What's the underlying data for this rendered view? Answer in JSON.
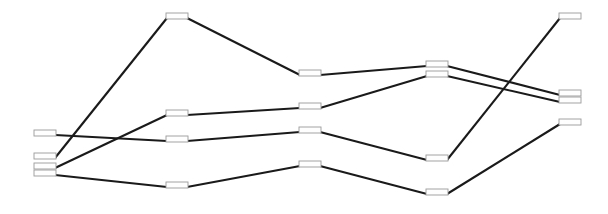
{
  "figure": {
    "type": "node-link-parallel-coordinates",
    "width": 608,
    "height": 214,
    "background_color": "#ffffff",
    "node_fill_color": "#fefefe",
    "node_border_color": "#9a9a9a",
    "link_color": "#1a1a1a",
    "link_width": 2.1,
    "node_width": 22,
    "node_height": 6,
    "column_count": 6,
    "series_count": 5
  },
  "columns": [
    {
      "id": "c1",
      "x": 45
    },
    {
      "id": "c2",
      "x": 177
    },
    {
      "id": "c3",
      "x": 310
    },
    {
      "id": "c4",
      "x": 437
    },
    {
      "id": "c5",
      "x": 570
    },
    {
      "id": "c6",
      "x": 570
    }
  ],
  "nodes": [
    {
      "id": "n1a",
      "label": "",
      "x": 45,
      "y": 133
    },
    {
      "id": "n1b",
      "label": "",
      "x": 45,
      "y": 156
    },
    {
      "id": "n1c",
      "label": "",
      "x": 45,
      "y": 166
    },
    {
      "id": "n1d",
      "label": "",
      "x": 45,
      "y": 173
    },
    {
      "id": "n2a",
      "label": "",
      "x": 177,
      "y": 16
    },
    {
      "id": "n2b",
      "label": "",
      "x": 177,
      "y": 113
    },
    {
      "id": "n2c",
      "label": "",
      "x": 177,
      "y": 139
    },
    {
      "id": "n2d",
      "label": "",
      "x": 177,
      "y": 185
    },
    {
      "id": "n3a",
      "label": "",
      "x": 310,
      "y": 73
    },
    {
      "id": "n3b",
      "label": "",
      "x": 310,
      "y": 106
    },
    {
      "id": "n3c",
      "label": "",
      "x": 310,
      "y": 130
    },
    {
      "id": "n3d",
      "label": "",
      "x": 310,
      "y": 164
    },
    {
      "id": "n4a",
      "label": "",
      "x": 437,
      "y": 64
    },
    {
      "id": "n4b",
      "label": "",
      "x": 437,
      "y": 74
    },
    {
      "id": "n4c",
      "label": "",
      "x": 437,
      "y": 158
    },
    {
      "id": "n4d",
      "label": "",
      "x": 437,
      "y": 192
    },
    {
      "id": "n5a",
      "label": "",
      "x": 570,
      "y": 16
    },
    {
      "id": "n5b",
      "label": "",
      "x": 570,
      "y": 93
    },
    {
      "id": "n5c",
      "label": "",
      "x": 570,
      "y": 100
    },
    {
      "id": "n5d",
      "label": "",
      "x": 570,
      "y": 122
    }
  ],
  "series": [
    {
      "name": "series-1",
      "node_ids": [
        "n1a",
        "n2c",
        "n3c",
        "n4c",
        "n5a"
      ],
      "points": [
        [
          45,
          133
        ],
        [
          177,
          139
        ],
        [
          310,
          130
        ],
        [
          437,
          158
        ],
        [
          570,
          16
        ]
      ]
    },
    {
      "name": "series-2",
      "node_ids": [
        "n1b",
        "n2a",
        "n3a",
        "n4a",
        "n5b"
      ],
      "points": [
        [
          45,
          156
        ],
        [
          177,
          16
        ],
        [
          310,
          73
        ],
        [
          437,
          64
        ],
        [
          570,
          93
        ]
      ]
    },
    {
      "name": "series-3",
      "node_ids": [
        "n1c",
        "n2b",
        "n3b",
        "n4b",
        "n5c"
      ],
      "points": [
        [
          45,
          166
        ],
        [
          177,
          113
        ],
        [
          310,
          106
        ],
        [
          437,
          74
        ],
        [
          570,
          100
        ]
      ]
    },
    {
      "name": "series-4",
      "node_ids": [
        "n1d",
        "n2d",
        "n3d",
        "n4d",
        "n5d"
      ],
      "points": [
        [
          45,
          173
        ],
        [
          177,
          185
        ],
        [
          310,
          164
        ],
        [
          437,
          192
        ],
        [
          570,
          122
        ]
      ]
    }
  ],
  "chart_data": {
    "type": "line",
    "xlabel": "",
    "ylabel": "",
    "categories": [
      "c1",
      "c2",
      "c3",
      "c4",
      "c5"
    ],
    "series": [
      {
        "name": "series-1",
        "values": [
          133,
          139,
          130,
          158,
          16
        ]
      },
      {
        "name": "series-2",
        "values": [
          156,
          16,
          73,
          64,
          93
        ]
      },
      {
        "name": "series-3",
        "values": [
          166,
          113,
          106,
          74,
          100
        ]
      },
      {
        "name": "series-4",
        "values": [
          173,
          185,
          164,
          192,
          122
        ]
      }
    ],
    "xlim": [
      0,
      608
    ],
    "ylim": [
      0,
      214
    ],
    "grid": false,
    "legend": "none"
  }
}
